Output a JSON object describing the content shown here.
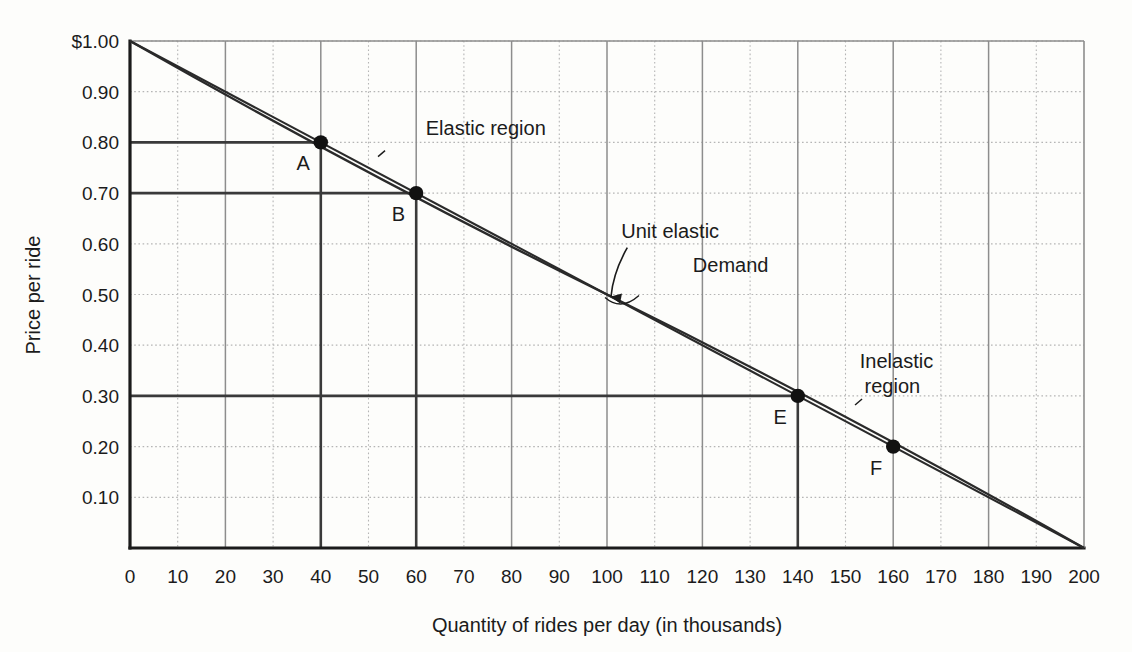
{
  "chart_data": {
    "type": "line",
    "title": "",
    "xlabel": "Quantity of rides per day (in thousands)",
    "ylabel": "Price per ride",
    "xlim": [
      0,
      200
    ],
    "ylim": [
      0,
      1.0
    ],
    "grid": true,
    "legend_position": "none",
    "x_ticks": [
      "0",
      "10",
      "20",
      "30",
      "40",
      "50",
      "60",
      "70",
      "80",
      "90",
      "100",
      "110",
      "120",
      "130",
      "140",
      "150",
      "160",
      "170",
      "180",
      "190",
      "200"
    ],
    "x_tick_values": [
      0,
      10,
      20,
      30,
      40,
      50,
      60,
      70,
      80,
      90,
      100,
      110,
      120,
      130,
      140,
      150,
      160,
      170,
      180,
      190,
      200
    ],
    "y_ticks": [
      "$1.00",
      "0.90",
      "0.80",
      "0.70",
      "0.60",
      "0.50",
      "0.40",
      "0.30",
      "0.20",
      "0.10"
    ],
    "y_tick_values": [
      1.0,
      0.9,
      0.8,
      0.7,
      0.6,
      0.5,
      0.4,
      0.3,
      0.2,
      0.1
    ],
    "series": [
      {
        "name": "Demand",
        "x": [
          0,
          200
        ],
        "y": [
          1.0,
          0.0
        ]
      },
      {
        "name": "Demand (second drawn line)",
        "x": [
          0,
          100,
          200
        ],
        "y": [
          1.0,
          0.5,
          0.0
        ]
      }
    ],
    "points": [
      {
        "label": "A",
        "x": 40,
        "y": 0.8
      },
      {
        "label": "B",
        "x": 60,
        "y": 0.7
      },
      {
        "label": "E",
        "x": 140,
        "y": 0.3
      },
      {
        "label": "F",
        "x": 160,
        "y": 0.2
      }
    ],
    "reference_lines": {
      "horizontal_price_levels": [
        0.8,
        0.7,
        0.3
      ],
      "vertical_quantity_levels": [
        40,
        60,
        140
      ]
    },
    "annotations": [
      {
        "name": "elastic-region",
        "text": "Elastic region",
        "x": 62,
        "y": 0.815
      },
      {
        "name": "unit-elastic",
        "text": "Unit elastic",
        "x": 103,
        "y": 0.612,
        "arrow_to_x": 100,
        "arrow_to_y": 0.5
      },
      {
        "name": "demand",
        "text": "Demand",
        "x": 118,
        "y": 0.545
      },
      {
        "name": "inelastic-region-line1",
        "text": "Inelastic",
        "x": 153,
        "y": 0.355
      },
      {
        "name": "inelastic-region-line2",
        "text": "region",
        "x": 154,
        "y": 0.305
      }
    ],
    "colors": {
      "axis": "#1b1b1b",
      "curve": "#2a2a2a",
      "major_grid": "#8d8d8d",
      "minor_grid": "#b5b5b5",
      "reference_line": "#3a3a3a",
      "point_fill": "#111111",
      "background": "#fdfdfb"
    }
  }
}
